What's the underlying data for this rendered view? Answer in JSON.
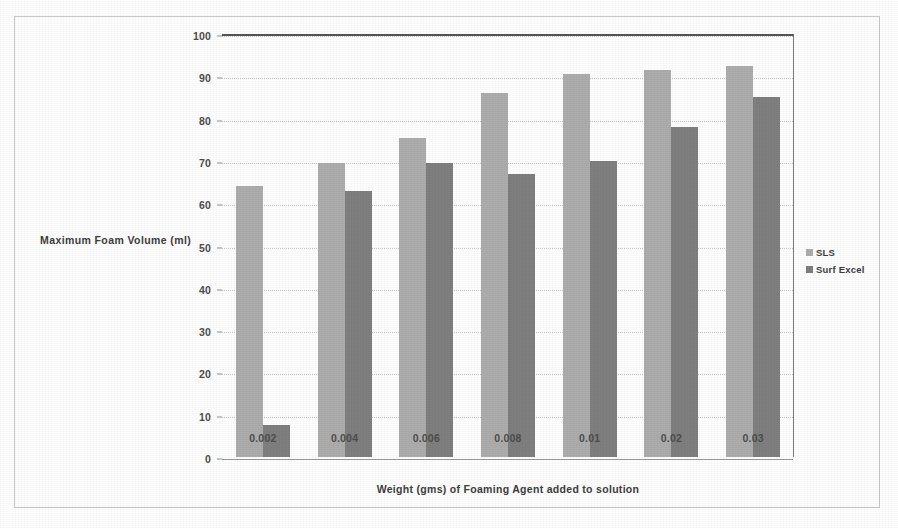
{
  "chart_data": {
    "type": "bar",
    "title": "",
    "xlabel": "Weight (gms) of Foaming Agent added to solution",
    "ylabel": "Maximum Foam Volume (ml)",
    "categories": [
      "0.002",
      "0.004",
      "0.006",
      "0.008",
      "0.01",
      "0.02",
      "0.03"
    ],
    "series": [
      {
        "name": "SLS",
        "color": "#adadad",
        "values": [
          64,
          69.5,
          75.5,
          86,
          90.5,
          91.5,
          92.5
        ]
      },
      {
        "name": "Surf Excel",
        "color": "#7f7f7f",
        "values": [
          7.5,
          63,
          69.5,
          67,
          70,
          78,
          85
        ]
      }
    ],
    "ylim": [
      0,
      100
    ],
    "yticks": [
      0,
      10,
      20,
      30,
      40,
      50,
      60,
      70,
      80,
      90,
      100
    ],
    "ytick_labels": [
      "0",
      "10",
      "20",
      "30",
      "40",
      "50",
      "60",
      "70",
      "80",
      "90",
      "100"
    ],
    "grid": true,
    "legend_position": "right"
  },
  "legend": {
    "items": [
      {
        "label": "SLS",
        "color": "#adadad"
      },
      {
        "label": "Surf Excel",
        "color": "#7f7f7f"
      }
    ]
  },
  "axes": {
    "y_title": "Maximum Foam Volume (ml)",
    "x_title": "Weight (gms) of Foaming Agent added to solution"
  },
  "colors": {
    "series_1": "#adadad",
    "series_2": "#7f7f7f",
    "gridline": "#c4c4c4",
    "axis": "#555555",
    "frame": "#c9c9c9",
    "text": "#3d3d3d"
  }
}
